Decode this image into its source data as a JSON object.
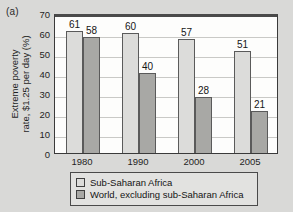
{
  "panel": {
    "label": "(a)"
  },
  "chart_data": {
    "type": "bar",
    "title": "",
    "xlabel": "",
    "ylabel": "Extreme poverty rate, $1.25 per day (%)",
    "ylabel_line1": "Extreme poverty",
    "ylabel_line2": "rate, $1.25 per day (%)",
    "categories": [
      "1980",
      "1990",
      "2000",
      "2005"
    ],
    "ylim": [
      0,
      70
    ],
    "yticks": [
      0,
      10,
      20,
      30,
      40,
      50,
      60,
      70
    ],
    "grid": true,
    "legend_position": "bottom",
    "series": [
      {
        "name": "Sub-Saharan Africa",
        "color": "#dcdcda",
        "values": [
          61,
          60,
          57,
          51
        ]
      },
      {
        "name": "World, excluding sub-Saharan Africa",
        "color": "#a8a8a5",
        "values": [
          58,
          40,
          28,
          21
        ]
      }
    ]
  }
}
